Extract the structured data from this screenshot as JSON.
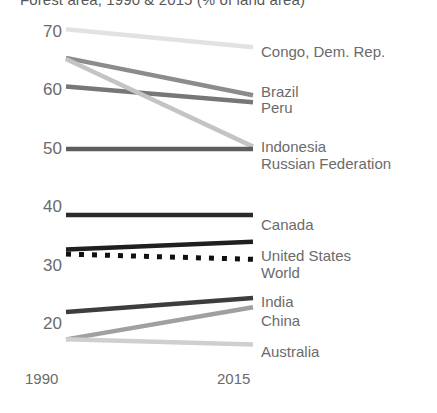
{
  "chart_data": {
    "type": "line",
    "title": "Forest area, 1990 & 2015 (% of land area)",
    "xlabel": "",
    "ylabel": "",
    "x": [
      "1990",
      "2015"
    ],
    "xlim": [
      1990,
      2015
    ],
    "ylim": [
      14,
      72
    ],
    "yticks": [
      70,
      60,
      50,
      40,
      30,
      20
    ],
    "ytick_labels": [
      "70",
      "60",
      "50",
      "40",
      "30",
      "20"
    ],
    "grid": false,
    "legend_position": "right-of-line-ends",
    "series": [
      {
        "name": "Congo, Dem. Rep.",
        "values": [
          70.3,
          67.2
        ],
        "color": "#e2e2e2",
        "style": "solid"
      },
      {
        "name": "Brazil",
        "values": [
          65.4,
          59.0
        ],
        "color": "#8c8c8c",
        "style": "solid"
      },
      {
        "name": "Peru",
        "values": [
          60.5,
          57.8
        ],
        "color": "#777777",
        "style": "solid"
      },
      {
        "name": "Indonesia",
        "values": [
          65.2,
          50.2
        ],
        "color": "#c4c4c4",
        "style": "solid"
      },
      {
        "name": "Russian Federation",
        "values": [
          49.8,
          49.8
        ],
        "color": "#5e5e5e",
        "style": "solid"
      },
      {
        "name": "Canada",
        "values": [
          38.5,
          38.5
        ],
        "color": "#2b2b2b",
        "style": "solid"
      },
      {
        "name": "United States",
        "values": [
          32.6,
          33.9
        ],
        "color": "#1f1f1f",
        "style": "solid"
      },
      {
        "name": "World",
        "values": [
          31.8,
          30.9
        ],
        "color": "#111111",
        "style": "dotted"
      },
      {
        "name": "India",
        "values": [
          21.9,
          24.3
        ],
        "color": "#3d3d3d",
        "style": "solid"
      },
      {
        "name": "China",
        "values": [
          17.2,
          22.7
        ],
        "color": "#a0a0a0",
        "style": "solid"
      },
      {
        "name": "Australia",
        "values": [
          17.2,
          16.3
        ],
        "color": "#cfcfcf",
        "style": "solid"
      }
    ],
    "label_blocks": [
      {
        "text": "Congo, Dem. Rep.",
        "top": 44
      },
      {
        "text": "Brazil",
        "top": 84
      },
      {
        "text": "Peru",
        "top": 100
      },
      {
        "text": "Indonesia",
        "top": 139
      },
      {
        "text": "Russian Federation",
        "top": 156
      },
      {
        "text": "Canada",
        "top": 217
      },
      {
        "text": "United States",
        "top": 248
      },
      {
        "text": "World",
        "top": 265
      },
      {
        "text": "India",
        "top": 294
      },
      {
        "text": "China",
        "top": 313
      },
      {
        "text": "Australia",
        "top": 344
      }
    ]
  }
}
